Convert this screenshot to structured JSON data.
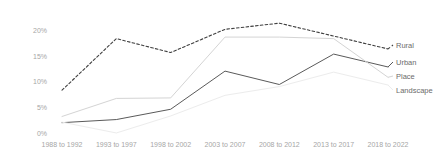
{
  "chart_data": {
    "type": "line",
    "title": "",
    "xlabel": "",
    "ylabel": "",
    "ylim": [
      0,
      22.5
    ],
    "grid": false,
    "legend_position": "right-end-of-line",
    "categories": [
      "1988 to 1992",
      "1993 to 1997",
      "1998 to 2002",
      "2003 to 2007",
      "2008 to 2012",
      "2013 to 2017",
      "2018 to 2022"
    ],
    "y_ticks": [
      0,
      5,
      10,
      15,
      20
    ],
    "y_tick_labels": [
      "0%",
      "5%",
      "10%",
      "15%",
      "20%"
    ],
    "series": [
      {
        "name": "Rural",
        "style": "dashed",
        "color": "#3f3f3f",
        "values": [
          8.5,
          18.5,
          15.8,
          20.3,
          21.5,
          19.0,
          16.5
        ]
      },
      {
        "name": "Urban",
        "style": "solid",
        "color": "#5a5a5a",
        "values": [
          2.2,
          2.8,
          4.8,
          12.2,
          9.6,
          15.5,
          13.0
        ]
      },
      {
        "name": "Place",
        "style": "solid",
        "color": "#d4d4d4",
        "values": [
          3.4,
          6.9,
          7.0,
          18.8,
          18.8,
          18.5,
          11.0
        ]
      },
      {
        "name": "Landscape",
        "style": "solid",
        "color": "#ececec",
        "values": [
          2.3,
          0.2,
          3.5,
          7.5,
          9.2,
          12.0,
          9.5
        ]
      }
    ]
  },
  "legend": {
    "items": [
      {
        "label": "Rural",
        "y": 45
      },
      {
        "label": "Urban",
        "y": 62
      },
      {
        "label": "Place",
        "y": 76
      },
      {
        "label": "Landscape",
        "y": 90
      }
    ]
  },
  "colors": {
    "axis_text": "#a6a6a6",
    "legend_text": "#6b6b6b",
    "background": "#ffffff"
  }
}
